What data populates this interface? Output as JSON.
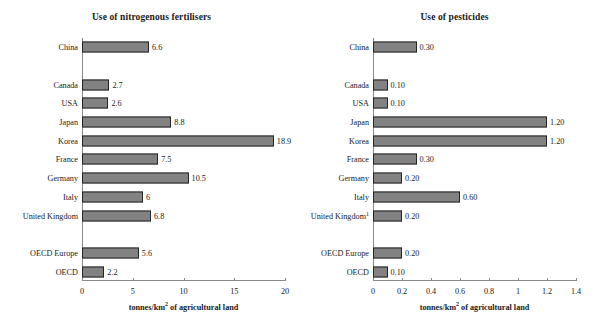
{
  "chart_data": [
    {
      "type": "bar",
      "orientation": "horizontal",
      "title": "Use of nitrogenous fertilisers",
      "xlabel": "tonnes/km2 of agricultural land",
      "xlabel_base": "tonnes/km",
      "xlabel_sup": "2",
      "xlabel_tail": " of agricultural land",
      "ylabel": "",
      "xlim": [
        0,
        20
      ],
      "xticks": [
        0,
        5,
        10,
        15,
        20
      ],
      "xticklabels": [
        "0",
        "5",
        "10",
        "15",
        "20"
      ],
      "grid": false,
      "legend": "none",
      "categories": [
        "China",
        "",
        "Canada",
        "USA",
        "Japan",
        "Korea",
        "France",
        "Germany",
        "Italy",
        "United Kingdom",
        "",
        "OECD Europe",
        "OECD"
      ],
      "values": [
        6.6,
        null,
        2.7,
        2.6,
        8.8,
        18.9,
        7.5,
        10.5,
        6,
        6.8,
        null,
        5.6,
        2.2
      ],
      "value_labels": [
        "6.6",
        "",
        "2.7",
        "2.6",
        "8.8",
        "18.9",
        "7.5",
        "10.5",
        "6",
        "6.8",
        "",
        "5.6",
        "2.2"
      ],
      "bar_color": "#828282",
      "bar_border_color": "#242424"
    },
    {
      "type": "bar",
      "orientation": "horizontal",
      "title": "Use of pesticides",
      "xlabel": "tonnes/km2 of agricultural land",
      "xlabel_base": "tonnes/km",
      "xlabel_sup": "2",
      "xlabel_tail": " of agricultural land",
      "ylabel": "",
      "xlim": [
        0,
        1.4
      ],
      "xticks": [
        0,
        0.2,
        0.4,
        0.6,
        0.8,
        1,
        1.2,
        1.4
      ],
      "xticklabels": [
        "0",
        "0.2",
        "0.4",
        "0.6",
        "0.8",
        "1",
        "1.2",
        "1.4"
      ],
      "grid": false,
      "legend": "none",
      "categories": [
        "China",
        "",
        "Canada",
        "USA",
        "Japan",
        "Korea",
        "France",
        "Germany",
        "Italy",
        "United Kingdom",
        "",
        "OECD Europe",
        "OECD"
      ],
      "category_footnotes": [
        "",
        "",
        "",
        "",
        "",
        "",
        "",
        "",
        "",
        "1",
        "",
        "",
        ""
      ],
      "values": [
        0.3,
        null,
        0.1,
        0.1,
        1.2,
        1.2,
        0.3,
        0.2,
        0.6,
        0.2,
        null,
        0.2,
        0.1
      ],
      "value_labels": [
        "0.30",
        "",
        "0.10",
        "0.10",
        "1.20",
        "1.20",
        "0.30",
        "0.20",
        "0.60",
        "0.20",
        "",
        "0.20",
        "0.10"
      ],
      "bar_color": "#828282",
      "bar_border_color": "#242424"
    }
  ],
  "panels": [
    {
      "name": "nitrogenous-fertilisers",
      "title": "Use of nitrogenous fertilisers"
    },
    {
      "name": "pesticides",
      "title": "Use of pesticides"
    }
  ]
}
